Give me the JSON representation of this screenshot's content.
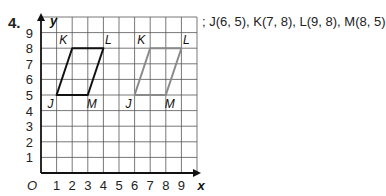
{
  "problem": {
    "number": "4.",
    "coordinates_text": "; J(6, 5), K(7, 8), L(9, 8), M(8, 5)",
    "image_vertices": [
      {
        "label": "J",
        "x": 6,
        "y": 5
      },
      {
        "label": "K",
        "x": 7,
        "y": 8
      },
      {
        "label": "L",
        "x": 9,
        "y": 8
      },
      {
        "label": "M",
        "x": 8,
        "y": 5
      }
    ]
  },
  "graph": {
    "x_axis_label": "x",
    "y_axis_label": "y",
    "origin_label": "O",
    "x_ticks": [
      "1",
      "2",
      "3",
      "4",
      "5",
      "6",
      "7",
      "8",
      "9"
    ],
    "y_ticks": [
      "1",
      "2",
      "3",
      "4",
      "5",
      "6",
      "7",
      "8",
      "9"
    ],
    "grid_range": {
      "x": [
        0,
        10
      ],
      "y": [
        0,
        10
      ]
    },
    "original_figure": {
      "color": "#111111",
      "vertices": [
        {
          "label": "J",
          "x": 1,
          "y": 5
        },
        {
          "label": "K",
          "x": 2,
          "y": 8
        },
        {
          "label": "L",
          "x": 4,
          "y": 8
        },
        {
          "label": "M",
          "x": 3,
          "y": 5
        }
      ]
    },
    "translated_figure": {
      "color": "#8a8a8a",
      "vertices": [
        {
          "label": "J",
          "x": 6,
          "y": 5
        },
        {
          "label": "K",
          "x": 7,
          "y": 8
        },
        {
          "label": "L",
          "x": 9,
          "y": 8
        },
        {
          "label": "M",
          "x": 8,
          "y": 5
        }
      ]
    }
  }
}
